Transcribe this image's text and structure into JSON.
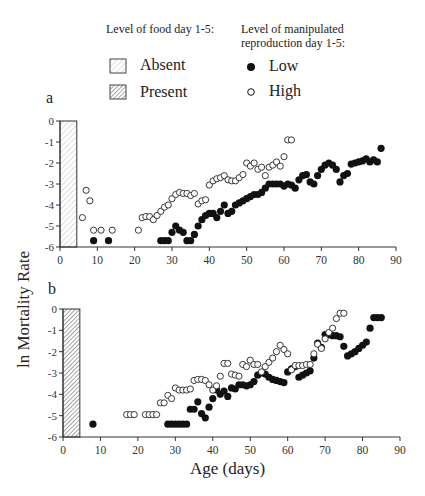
{
  "legend": {
    "food_title": "Level of food day 1-5:",
    "food_items": [
      {
        "label": "Absent",
        "pattern": "light-hatch"
      },
      {
        "label": "Present",
        "pattern": "dense-hatch"
      }
    ],
    "repro_title_line1": "Level of manipulated",
    "repro_title_line2": "reproduction day 1-5:",
    "repro_items": [
      {
        "label": "Low",
        "marker": "filled-circle"
      },
      {
        "label": "High",
        "marker": "open-circle"
      }
    ]
  },
  "axis": {
    "ylabel": "ln Mortality Rate",
    "xlabel": "Age (days)"
  },
  "panels": {
    "a": {
      "letter": "a"
    },
    "b": {
      "letter": "b"
    }
  },
  "chart_data": [
    {
      "type": "scatter",
      "panel": "a",
      "title": "",
      "xlabel": "Age (days)",
      "ylabel": "ln Mortality Rate",
      "xlim": [
        0,
        90
      ],
      "ylim": [
        -6,
        0
      ],
      "xticks": [
        0,
        10,
        20,
        30,
        40,
        50,
        60,
        70,
        80,
        90
      ],
      "yticks": [
        0,
        -1,
        -2,
        -3,
        -4,
        -5,
        -6
      ],
      "food_bar": {
        "condition": "Absent",
        "x_start": 0,
        "x_end": 4.5,
        "y_top": 0,
        "pattern": "light-hatch"
      },
      "series": [
        {
          "name": "Low",
          "marker": "filled",
          "points": [
            [
              9,
              -5.7
            ],
            [
              13,
              -5.7
            ],
            [
              27,
              -5.7
            ],
            [
              28,
              -5.7
            ],
            [
              29,
              -5.7
            ],
            [
              30,
              -5.3
            ],
            [
              31,
              -5.0
            ],
            [
              32,
              -5.2
            ],
            [
              33,
              -5.3
            ],
            [
              34,
              -5.7
            ],
            [
              35,
              -5.7
            ],
            [
              36,
              -5.4
            ],
            [
              37,
              -5.0
            ],
            [
              38,
              -4.7
            ],
            [
              39,
              -4.5
            ],
            [
              40,
              -4.4
            ],
            [
              41,
              -4.4
            ],
            [
              42,
              -4.6
            ],
            [
              43,
              -4.3
            ],
            [
              44,
              -4.0
            ],
            [
              45,
              -4.4
            ],
            [
              46,
              -4.3
            ],
            [
              47,
              -4.0
            ],
            [
              48,
              -3.9
            ],
            [
              49,
              -3.8
            ],
            [
              50,
              -3.7
            ],
            [
              51,
              -3.6
            ],
            [
              52,
              -3.5
            ],
            [
              53,
              -3.5
            ],
            [
              54,
              -3.4
            ],
            [
              55,
              -3.2
            ],
            [
              56,
              -3.0
            ],
            [
              57,
              -3.0
            ],
            [
              58,
              -3.0
            ],
            [
              59,
              -3.0
            ],
            [
              60,
              -3.1
            ],
            [
              61,
              -3.0
            ],
            [
              62,
              -3.05
            ],
            [
              63,
              -3.2
            ],
            [
              64,
              -2.8
            ],
            [
              65,
              -2.6
            ],
            [
              66,
              -2.55
            ],
            [
              67,
              -2.9
            ],
            [
              68,
              -3.0
            ],
            [
              69,
              -2.6
            ],
            [
              70,
              -2.3
            ],
            [
              71,
              -2.1
            ],
            [
              72,
              -2.0
            ],
            [
              73,
              -2.1
            ],
            [
              74,
              -2.3
            ],
            [
              75,
              -2.9
            ],
            [
              76,
              -2.6
            ],
            [
              77,
              -2.5
            ],
            [
              78,
              -2.05
            ],
            [
              79,
              -2.0
            ],
            [
              80,
              -1.95
            ],
            [
              81,
              -1.9
            ],
            [
              82,
              -1.8
            ],
            [
              83,
              -1.95
            ],
            [
              84,
              -1.85
            ],
            [
              85,
              -1.95
            ],
            [
              86,
              -1.3
            ]
          ]
        },
        {
          "name": "High",
          "marker": "open",
          "points": [
            [
              6,
              -4.6
            ],
            [
              7,
              -3.3
            ],
            [
              8,
              -3.8
            ],
            [
              9,
              -5.2
            ],
            [
              11,
              -5.2
            ],
            [
              14,
              -5.2
            ],
            [
              21,
              -5.2
            ],
            [
              22,
              -4.6
            ],
            [
              23,
              -4.55
            ],
            [
              24,
              -4.55
            ],
            [
              25,
              -4.7
            ],
            [
              26,
              -4.5
            ],
            [
              27,
              -4.3
            ],
            [
              28,
              -4.1
            ],
            [
              29,
              -4.0
            ],
            [
              30,
              -3.7
            ],
            [
              31,
              -3.5
            ],
            [
              32,
              -3.4
            ],
            [
              33,
              -3.45
            ],
            [
              34,
              -3.45
            ],
            [
              35,
              -3.55
            ],
            [
              36,
              -3.45
            ],
            [
              37,
              -3.95
            ],
            [
              38,
              -3.8
            ],
            [
              39,
              -3.75
            ],
            [
              40,
              -3.05
            ],
            [
              41,
              -2.85
            ],
            [
              42,
              -2.75
            ],
            [
              43,
              -2.7
            ],
            [
              44,
              -2.6
            ],
            [
              45,
              -2.8
            ],
            [
              46,
              -2.85
            ],
            [
              47,
              -2.85
            ],
            [
              48,
              -2.7
            ],
            [
              49,
              -2.55
            ],
            [
              50,
              -2.0
            ],
            [
              51,
              -2.15
            ],
            [
              52,
              -2.0
            ],
            [
              53,
              -2.3
            ],
            [
              54,
              -2.2
            ],
            [
              55,
              -2.6
            ],
            [
              56,
              -2.2
            ],
            [
              57,
              -2.1
            ],
            [
              58,
              -1.95
            ],
            [
              59,
              -2.15
            ],
            [
              60,
              -1.7
            ],
            [
              61,
              -0.9
            ],
            [
              62,
              -0.9
            ]
          ]
        }
      ]
    },
    {
      "type": "scatter",
      "panel": "b",
      "title": "",
      "xlabel": "Age (days)",
      "ylabel": "ln Mortality Rate",
      "xlim": [
        0,
        90
      ],
      "ylim": [
        -6,
        0
      ],
      "xticks": [
        0,
        10,
        20,
        30,
        40,
        50,
        60,
        70,
        80,
        90
      ],
      "yticks": [
        0,
        -1,
        -2,
        -3,
        -4,
        -5,
        -6
      ],
      "food_bar": {
        "condition": "Present",
        "x_start": 0,
        "x_end": 4.5,
        "y_top": 0,
        "pattern": "dense-hatch"
      },
      "series": [
        {
          "name": "Low",
          "marker": "filled",
          "points": [
            [
              8,
              -5.4
            ],
            [
              28,
              -5.4
            ],
            [
              29,
              -5.4
            ],
            [
              30,
              -5.4
            ],
            [
              31,
              -5.4
            ],
            [
              32,
              -5.4
            ],
            [
              33,
              -5.4
            ],
            [
              34,
              -4.7
            ],
            [
              35,
              -4.7
            ],
            [
              36,
              -4.35
            ],
            [
              37,
              -4.9
            ],
            [
              38,
              -5.1
            ],
            [
              39,
              -4.6
            ],
            [
              40,
              -4.2
            ],
            [
              41,
              -3.8
            ],
            [
              42,
              -4.0
            ],
            [
              43,
              -3.85
            ],
            [
              44,
              -4.1
            ],
            [
              45,
              -3.7
            ],
            [
              46,
              -3.75
            ],
            [
              47,
              -3.55
            ],
            [
              48,
              -3.55
            ],
            [
              49,
              -3.6
            ],
            [
              50,
              -3.55
            ],
            [
              51,
              -3.4
            ],
            [
              52,
              -3.1
            ],
            [
              53,
              -3.0
            ],
            [
              54,
              -3.05
            ],
            [
              55,
              -3.2
            ],
            [
              56,
              -3.3
            ],
            [
              57,
              -3.35
            ],
            [
              58,
              -3.4
            ],
            [
              59,
              -3.45
            ],
            [
              60,
              -2.95
            ],
            [
              61,
              -2.8
            ],
            [
              62,
              -2.7
            ],
            [
              63,
              -3.2
            ],
            [
              64,
              -3.1
            ],
            [
              65,
              -3.0
            ],
            [
              66,
              -2.9
            ],
            [
              67,
              -2.3
            ],
            [
              68,
              -1.6
            ],
            [
              69,
              -1.8
            ],
            [
              70,
              -1.2
            ],
            [
              71,
              -1.2
            ],
            [
              72,
              -1.25
            ],
            [
              73,
              -1.25
            ],
            [
              74,
              -1.3
            ],
            [
              75,
              -1.75
            ],
            [
              76,
              -2.2
            ],
            [
              77,
              -2.1
            ],
            [
              78,
              -2.0
            ],
            [
              79,
              -1.85
            ],
            [
              80,
              -1.7
            ],
            [
              81,
              -1.55
            ],
            [
              82,
              -0.9
            ],
            [
              83,
              -0.4
            ],
            [
              84,
              -0.4
            ],
            [
              85,
              -0.4
            ]
          ]
        },
        {
          "name": "High",
          "marker": "open",
          "points": [
            [
              17,
              -4.95
            ],
            [
              18,
              -4.95
            ],
            [
              19,
              -4.95
            ],
            [
              22,
              -4.95
            ],
            [
              23,
              -4.95
            ],
            [
              24,
              -4.95
            ],
            [
              25,
              -4.95
            ],
            [
              26,
              -4.4
            ],
            [
              27,
              -4.4
            ],
            [
              28,
              -4.05
            ],
            [
              29,
              -4.2
            ],
            [
              30,
              -3.7
            ],
            [
              31,
              -3.8
            ],
            [
              32,
              -3.8
            ],
            [
              33,
              -3.8
            ],
            [
              34,
              -3.75
            ],
            [
              35,
              -3.35
            ],
            [
              36,
              -3.3
            ],
            [
              37,
              -3.3
            ],
            [
              38,
              -3.35
            ],
            [
              39,
              -3.55
            ],
            [
              40,
              -3.8
            ],
            [
              41,
              -3.6
            ],
            [
              42,
              -3.15
            ],
            [
              43,
              -2.55
            ],
            [
              44,
              -2.55
            ],
            [
              45,
              -3.05
            ],
            [
              46,
              -3.1
            ],
            [
              47,
              -3.15
            ],
            [
              48,
              -2.6
            ],
            [
              49,
              -2.7
            ],
            [
              50,
              -2.4
            ],
            [
              51,
              -2.6
            ],
            [
              52,
              -2.6
            ],
            [
              53,
              -2.95
            ],
            [
              54,
              -2.7
            ],
            [
              55,
              -2.5
            ],
            [
              56,
              -2.3
            ],
            [
              57,
              -2.0
            ],
            [
              58,
              -1.7
            ],
            [
              59,
              -1.9
            ],
            [
              60,
              -2.1
            ],
            [
              61,
              -2.85
            ],
            [
              62,
              -2.65
            ],
            [
              63,
              -2.65
            ],
            [
              64,
              -2.65
            ],
            [
              65,
              -2.6
            ],
            [
              66,
              -2.6
            ],
            [
              67,
              -2.1
            ],
            [
              68,
              -1.65
            ],
            [
              69,
              -1.85
            ],
            [
              70,
              -1.4
            ],
            [
              71,
              -1.1
            ],
            [
              72,
              -0.9
            ],
            [
              73,
              -0.45
            ],
            [
              74,
              -0.2
            ],
            [
              75,
              -0.2
            ]
          ]
        }
      ]
    }
  ]
}
